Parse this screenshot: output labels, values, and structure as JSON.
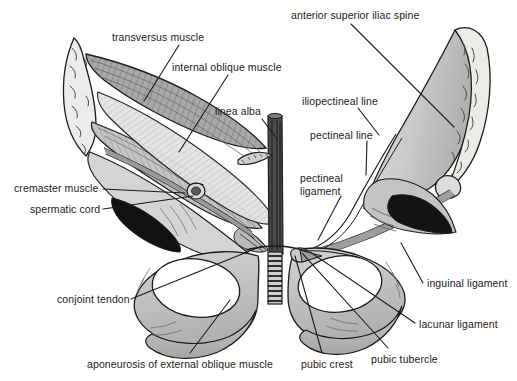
{
  "figure": {
    "background_color": "#ffffff",
    "ink_color": "#1b1b1b",
    "tones": {
      "bone_light": "#d9d9d9",
      "bone_mid": "#bcbcbc",
      "bone_dark": "#9a9a9a",
      "muscle_mid": "#a8a8a8",
      "muscle_dark": "#808080",
      "aponeurosis_light": "#e6e6e6",
      "cavity_black": "#111111",
      "linea_alba_dark": "#3a3a3a"
    }
  },
  "labels": [
    {
      "id": "transversus-muscle",
      "text": "transversus muscle",
      "x": 112,
      "y": 31,
      "align": "left",
      "leader": [
        [
          179,
          45
        ],
        [
          144,
          101
        ]
      ]
    },
    {
      "id": "internal-oblique-muscle",
      "text": "internal oblique muscle",
      "x": 172,
      "y": 61,
      "align": "left",
      "leader": [
        [
          228,
          75
        ],
        [
          179,
          152
        ]
      ]
    },
    {
      "id": "linea-alba",
      "text": "linea alba",
      "x": 215,
      "y": 105,
      "align": "left",
      "leader": [
        [
          262,
          119
        ],
        [
          277,
          139
        ]
      ]
    },
    {
      "id": "cremaster-muscle",
      "text": "cremaster muscle",
      "x": 14,
      "y": 182,
      "align": "left",
      "leader": [
        [
          103,
          189
        ],
        [
          185,
          193
        ]
      ]
    },
    {
      "id": "spermatic-cord",
      "text": "spermatic cord",
      "x": 30,
      "y": 203,
      "align": "left",
      "leader": [
        [
          103,
          209
        ],
        [
          193,
          196
        ]
      ]
    },
    {
      "id": "conjoint-tendon",
      "text": "conjoint tendon",
      "x": 57,
      "y": 293,
      "align": "left",
      "leader": [
        [
          131,
          299
        ],
        [
          262,
          246
        ]
      ]
    },
    {
      "id": "aponeurosis-of-external-oblique-muscle",
      "text": "aponeurosis of external oblique muscle",
      "x": 87,
      "y": 358,
      "align": "left",
      "leader": [
        [
          190,
          353
        ],
        [
          230,
          300
        ]
      ]
    },
    {
      "id": "anterior-superior-iliac-spine",
      "text": "anterior superior iliac spine",
      "x": 291,
      "y": 9,
      "align": "left",
      "leader": [
        [
          351,
          24
        ],
        [
          454,
          127
        ]
      ]
    },
    {
      "id": "iliopectineal-line",
      "text": "iliopectineal line",
      "x": 302,
      "y": 95,
      "align": "left",
      "leader": [
        [
          358,
          108
        ],
        [
          379,
          135
        ]
      ]
    },
    {
      "id": "pectineal-line",
      "text": "pectineal line",
      "x": 310,
      "y": 129,
      "align": "left",
      "leader": [
        [
          367,
          141
        ],
        [
          366,
          175
        ]
      ]
    },
    {
      "id": "pectineal-ligament",
      "text": "pectineal\nligament",
      "x": 300,
      "y": 172,
      "align": "left",
      "leader": [
        [
          341,
          196
        ],
        [
          318,
          240
        ]
      ]
    },
    {
      "id": "inguinal-ligament",
      "text": "inguinal ligament",
      "x": 427,
      "y": 277,
      "align": "left",
      "leader": [
        [
          423,
          283
        ],
        [
          401,
          243
        ]
      ]
    },
    {
      "id": "lacunar-ligament",
      "text": "lacunar ligament",
      "x": 419,
      "y": 318,
      "align": "left",
      "leader": [
        [
          415,
          323
        ],
        [
          310,
          252
        ]
      ]
    },
    {
      "id": "pubic-tubercle",
      "text": "pubic tubercle",
      "x": 371,
      "y": 353,
      "align": "left",
      "leader": [
        [
          388,
          348
        ],
        [
          302,
          253
        ]
      ]
    },
    {
      "id": "pubic-crest",
      "text": "pubic crest",
      "x": 301,
      "y": 358,
      "align": "left",
      "leader": [
        [
          322,
          353
        ],
        [
          295,
          256
        ]
      ]
    }
  ]
}
